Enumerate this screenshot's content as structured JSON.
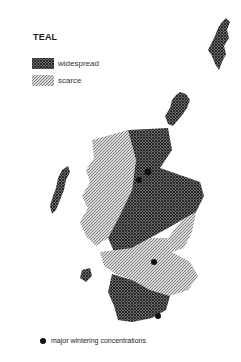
{
  "map": {
    "title": "TEAL",
    "legend": [
      {
        "key": "widespread",
        "label": "widespread",
        "pattern": "crosshatch-dense"
      },
      {
        "key": "scarce",
        "label": "scarce",
        "pattern": "diagonal-light"
      }
    ],
    "footer_legend": {
      "symbol": "filled-dot",
      "label": "major wintering concentrations"
    },
    "colors": {
      "widespread": "#4a4a4a",
      "scarce": "#9a9a9a",
      "dot": "#111111",
      "background": "#ffffff"
    }
  }
}
